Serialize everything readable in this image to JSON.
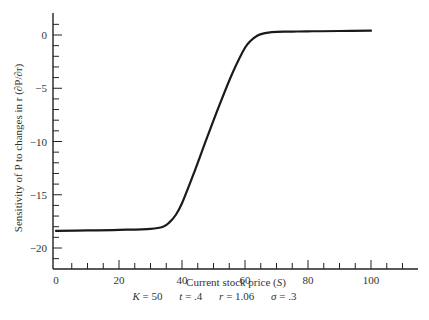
{
  "chart_data": {
    "type": "line",
    "title": "",
    "xlabel": "Current stock price (S)",
    "ylabel": "Sensitivity of P to changes in r (∂P/∂r)",
    "xlim": [
      0,
      115
    ],
    "ylim": [
      -22,
      1.8
    ],
    "x_ticks": [
      0,
      20,
      40,
      60,
      80,
      100
    ],
    "y_ticks": [
      0,
      -5,
      -10,
      -15,
      -20
    ],
    "grid": false,
    "legend": null,
    "series": [
      {
        "name": "dP/dr",
        "x": [
          0,
          10,
          20,
          30,
          34,
          36,
          38,
          40,
          44,
          48,
          52,
          56,
          60,
          62,
          64,
          66,
          68,
          70,
          75,
          80,
          90,
          100
        ],
        "y": [
          -18.4,
          -18.35,
          -18.3,
          -18.2,
          -18.0,
          -17.6,
          -16.9,
          -15.8,
          -12.8,
          -9.6,
          -6.5,
          -3.6,
          -1.2,
          -0.5,
          -0.05,
          0.15,
          0.25,
          0.3,
          0.32,
          0.35,
          0.38,
          0.4
        ]
      }
    ],
    "annotations": {
      "params": [
        {
          "name": "K",
          "value": "50"
        },
        {
          "name": "t",
          "value": ".4"
        },
        {
          "name": "r",
          "value": "1.06"
        },
        {
          "name": "σ",
          "value": ".3"
        }
      ]
    }
  },
  "labels": {
    "xlabel_text": "Current stock price (",
    "xlabel_var": "S",
    "xlabel_end": ")",
    "ylabel": "Sensitivity of P to changes in r (∂P/∂r)",
    "K": "K",
    "K_val": " = 50",
    "t": "t",
    "t_val": " = .4",
    "r": "r",
    "r_val": " = 1.06",
    "sigma": "σ",
    "sigma_val": " = .3"
  }
}
